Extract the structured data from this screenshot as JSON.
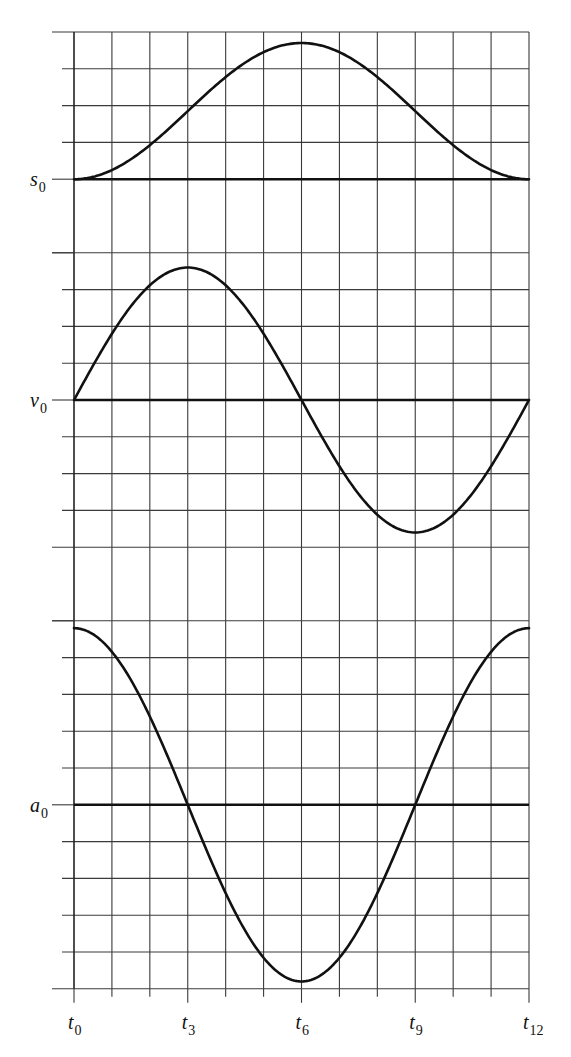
{
  "chart_data": {
    "type": "line",
    "title": "",
    "x": [
      "t0",
      "t1",
      "t2",
      "t3",
      "t4",
      "t5",
      "t6",
      "t7",
      "t8",
      "t9",
      "t10",
      "t11",
      "t12"
    ],
    "x_tick_labels": [
      {
        "base": "t",
        "sub": "0",
        "index": 0
      },
      {
        "base": "t",
        "sub": "3",
        "index": 3
      },
      {
        "base": "t",
        "sub": "6",
        "index": 6
      },
      {
        "base": "t",
        "sub": "9",
        "index": 9
      },
      {
        "base": "t",
        "sub": "12",
        "index": 12
      }
    ],
    "grid": true,
    "panels": [
      {
        "name": "position",
        "axis_label": {
          "base": "s",
          "sub": "0"
        },
        "units_above_axis": 4,
        "units_below_axis": 0,
        "series": [
          {
            "name": "s(t)",
            "shape": "raised cosine (1 - cos)",
            "values": [
              0,
              0.25,
              0.93,
              1.85,
              2.78,
              3.45,
              3.7,
              3.45,
              2.78,
              1.85,
              0.93,
              0.25,
              0
            ]
          }
        ]
      },
      {
        "name": "velocity",
        "axis_label": {
          "base": "v",
          "sub": "0"
        },
        "units_above_axis": 4,
        "units_below_axis": 4,
        "series": [
          {
            "name": "v(t)",
            "shape": "sine",
            "values": [
              0,
              1.8,
              3.12,
              3.6,
              3.12,
              1.8,
              0,
              -1.8,
              -3.12,
              -3.6,
              -3.12,
              -1.8,
              0
            ]
          }
        ]
      },
      {
        "name": "acceleration",
        "axis_label": {
          "base": "a",
          "sub": "0"
        },
        "units_above_axis": 5,
        "units_below_axis": 5,
        "series": [
          {
            "name": "a(t)",
            "shape": "cosine",
            "values": [
              4.8,
              4.16,
              2.4,
              0,
              -2.4,
              -4.16,
              -4.8,
              -4.16,
              -2.4,
              0,
              2.4,
              4.16,
              4.8
            ]
          }
        ]
      }
    ]
  }
}
